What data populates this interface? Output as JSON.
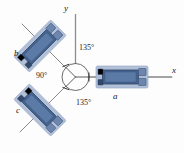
{
  "figure": {
    "axes": {
      "y_label": "y",
      "x_label": "x"
    },
    "angles": [
      {
        "id": "angle-top",
        "value": "135°"
      },
      {
        "id": "angle-left",
        "value": "90°"
      },
      {
        "id": "angle-bottom",
        "value": "135°"
      }
    ],
    "gauges": [
      {
        "id": "gauge-a",
        "label": "a",
        "orientation_deg": 0
      },
      {
        "id": "gauge-b",
        "label": "b",
        "orientation_deg": 135
      },
      {
        "id": "gauge-c",
        "label": "c",
        "orientation_deg": 225
      }
    ],
    "colors": {
      "pad_fill": "#aebdd6",
      "pad_stroke": "#8fa3c4",
      "grid_fill": "#46638f",
      "grid_stroke": "#2f4669",
      "tab_fill": "#6d86ad",
      "axis_line": "#8c8c8c",
      "circle_line": "#5a5a5a",
      "lead_line": "#7a7a7a",
      "background": "#fdfdfd"
    }
  }
}
